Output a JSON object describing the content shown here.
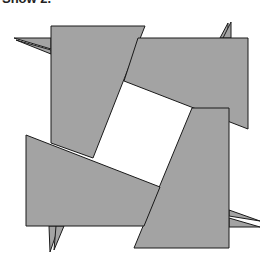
{
  "caption": "Show 2.",
  "colors": {
    "piece_fill": "#a3a3a3",
    "stroke": "#1a1a1a",
    "background": "#ffffff",
    "center": "#ffffff"
  },
  "diagram": {
    "type": "pinwheel-square-dissection",
    "pieces": [
      {
        "id": "top-left",
        "points": "51,26 145,26 93,158 51,143"
      },
      {
        "id": "top-right",
        "points": "138,38 248,38 248,129 124,81"
      },
      {
        "id": "bottom-right",
        "points": "192,108 229,108 229,248 134,248"
      },
      {
        "id": "bottom-left",
        "points": "26,135 160,187 144,226 26,226"
      }
    ],
    "spikes": [
      {
        "id": "left-spike-a",
        "points": "14,38 51,38 51,49"
      },
      {
        "id": "left-spike-b",
        "points": "16,40 51,50 51,54"
      },
      {
        "id": "top-spike-a",
        "points": "220,38 228,23 228,38"
      },
      {
        "id": "top-spike-b",
        "points": "223,38 231,22 231,38"
      },
      {
        "id": "right-spike-a",
        "points": "229,210 260,221 229,216"
      },
      {
        "id": "right-spike-b",
        "points": "229,218 260,227 229,227"
      },
      {
        "id": "bottom-spike-a",
        "points": "49,226 59,226 50,252"
      },
      {
        "id": "bottom-spike-b",
        "points": "56,226 64,226 54,250"
      }
    ]
  }
}
